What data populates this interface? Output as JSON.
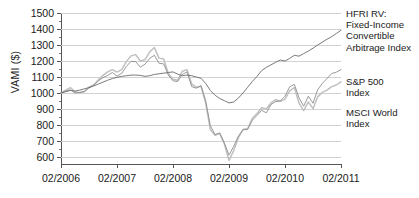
{
  "chart_data": {
    "type": "line",
    "title": "",
    "xlabel": "",
    "ylabel": "VAMI ($)",
    "ylim": [
      550,
      1500
    ],
    "yticks": [
      600,
      700,
      800,
      900,
      1000,
      1100,
      1200,
      1300,
      1400,
      1500
    ],
    "xtick_labels": [
      "02/2006",
      "02/2007",
      "02/2008",
      "02/2009",
      "02/2010",
      "02/2011"
    ],
    "xlim": [
      "02/2006",
      "02/2011"
    ],
    "grid": true,
    "legend_position": "right",
    "x": [
      "02/2006",
      "03/2006",
      "04/2006",
      "05/2006",
      "06/2006",
      "07/2006",
      "08/2006",
      "09/2006",
      "10/2006",
      "11/2006",
      "12/2006",
      "01/2007",
      "02/2007",
      "03/2007",
      "04/2007",
      "05/2007",
      "06/2007",
      "07/2007",
      "08/2007",
      "09/2007",
      "10/2007",
      "11/2007",
      "12/2007",
      "01/2008",
      "02/2008",
      "03/2008",
      "04/2008",
      "05/2008",
      "06/2008",
      "07/2008",
      "08/2008",
      "09/2008",
      "10/2008",
      "11/2008",
      "12/2008",
      "01/2009",
      "02/2009",
      "03/2009",
      "04/2009",
      "05/2009",
      "06/2009",
      "07/2009",
      "08/2009",
      "09/2009",
      "10/2009",
      "11/2009",
      "12/2009",
      "01/2010",
      "02/2010",
      "03/2010",
      "04/2010",
      "05/2010",
      "06/2010",
      "07/2010",
      "08/2010",
      "09/2010",
      "10/2010",
      "11/2010",
      "12/2010",
      "01/2011",
      "02/2011"
    ],
    "series": [
      {
        "name": "HFRI RV: Fixed-Income Convertible Arbitrage Index",
        "color": "#6b6b6b",
        "values": [
          1000,
          1008,
          1016,
          1012,
          1018,
          1026,
          1034,
          1044,
          1056,
          1068,
          1080,
          1090,
          1098,
          1104,
          1108,
          1112,
          1112,
          1110,
          1104,
          1108,
          1116,
          1120,
          1124,
          1128,
          1132,
          1118,
          1108,
          1112,
          1108,
          1100,
          1092,
          1060,
          1016,
          986,
          966,
          952,
          938,
          944,
          968,
          1000,
          1036,
          1072,
          1104,
          1140,
          1160,
          1176,
          1192,
          1206,
          1200,
          1216,
          1236,
          1230,
          1246,
          1262,
          1280,
          1300,
          1318,
          1336,
          1352,
          1372,
          1392
        ]
      },
      {
        "name": "S&P 500 Index",
        "color": "#8f8f8f",
        "values": [
          1000,
          1012,
          1020,
          1000,
          1004,
          1010,
          1032,
          1048,
          1076,
          1096,
          1110,
          1128,
          1106,
          1122,
          1166,
          1198,
          1196,
          1162,
          1180,
          1216,
          1236,
          1186,
          1182,
          1112,
          1076,
          1072,
          1116,
          1132,
          1040,
          1030,
          1046,
          952,
          796,
          740,
          750,
          688,
          612,
          666,
          730,
          770,
          772,
          830,
          860,
          892,
          876,
          928,
          946,
          950,
          980,
          1038,
          1054,
          970,
          918,
          980,
          936,
          1020,
          1060,
          1090,
          1122,
          1130,
          1146
        ]
      },
      {
        "name": "MSCI World Index",
        "color": "#c0c0c0",
        "values": [
          1000,
          1018,
          1034,
          1008,
          1002,
          1008,
          1036,
          1050,
          1082,
          1110,
          1132,
          1146,
          1130,
          1146,
          1196,
          1232,
          1240,
          1200,
          1208,
          1256,
          1284,
          1218,
          1212,
          1122,
          1086,
          1080,
          1136,
          1146,
          1056,
          1036,
          1042,
          938,
          772,
          736,
          748,
          682,
          578,
          640,
          720,
          772,
          778,
          840,
          872,
          908,
          900,
          938,
          958,
          948,
          962,
          1014,
          1034,
          938,
          890,
          944,
          902,
          976,
          1004,
          1018,
          1040,
          1050,
          1070
        ]
      }
    ]
  },
  "legend": {
    "entries": [
      {
        "label": "HFRI RV:\nFixed-Income\nConvertible\nArbitrage Index"
      },
      {
        "label": "S&P 500\nIndex"
      },
      {
        "label": "MSCI World\nIndex"
      }
    ]
  }
}
